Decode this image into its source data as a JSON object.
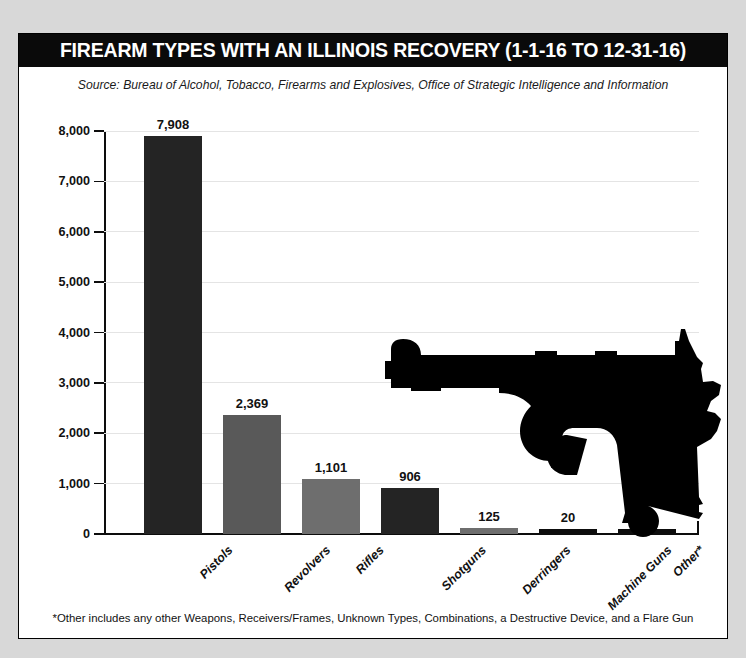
{
  "header": {
    "title": "FIREARM TYPES WITH AN ILLINOIS RECOVERY (1-1-16 TO 12-31-16)",
    "source": "Source: Bureau of Alcohol, Tobacco, Firearms and Explosives, Office of Strategic Intelligence and Information"
  },
  "footnote": "*Other includes any other Weapons, Receivers/Frames, Unknown Types, Combinations, a Destructive Device, and a Flare Gun",
  "decoration": {
    "pistol_icon": "pistol-silhouette",
    "pistol_color": "#000000"
  },
  "colors": {
    "title_band": "#0a0a0a",
    "page_background": "#d8d8d8",
    "card_background": "#ffffff",
    "gridline": "#e4e4e4",
    "axis": "#0d0d0d",
    "bar_dark": "#242424",
    "bar_gray": "#595959",
    "bar_light_gray": "#6e6e6e"
  },
  "chart_data": {
    "type": "bar",
    "title": "FIREARM TYPES WITH AN ILLINOIS RECOVERY (1-1-16 TO 12-31-16)",
    "subtitle": "Source: Bureau of Alcohol, Tobacco, Firearms and Explosives, Office of Strategic Intelligence and Information",
    "xlabel": "",
    "ylabel": "",
    "ylim": [
      0,
      8000
    ],
    "grid": true,
    "legend": "none",
    "categories": [
      "Pistols",
      "Revolvers",
      "Rifles",
      "Shotguns",
      "Derringers",
      "Machine Guns",
      "Other*"
    ],
    "values": [
      7908,
      2369,
      1101,
      906,
      125,
      20,
      38
    ],
    "value_labels": [
      "7,908",
      "2,369",
      "1,101",
      "906",
      "125",
      "20",
      "38"
    ],
    "bar_colors": [
      "#242424",
      "#595959",
      "#6e6e6e",
      "#242424",
      "#6e6e6e",
      "#0d0d0d",
      "#0d0d0d"
    ],
    "yticks": [
      0,
      1000,
      2000,
      3000,
      4000,
      5000,
      6000,
      7000,
      8000
    ],
    "ytick_labels": [
      "0",
      "1,000",
      "2,000",
      "3,000",
      "4,000",
      "5,000",
      "6,000",
      "7,000",
      "8,000"
    ]
  }
}
